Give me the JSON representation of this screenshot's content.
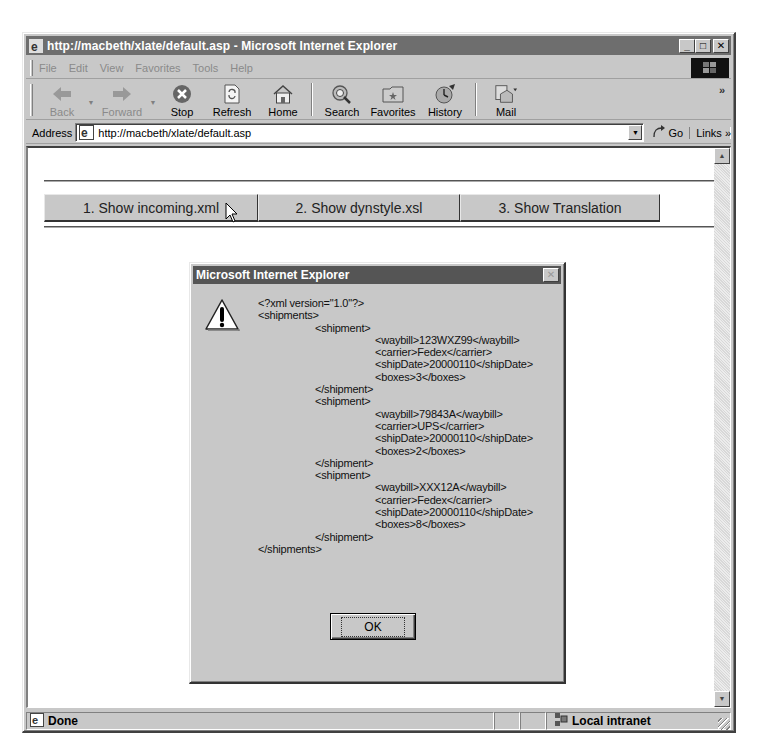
{
  "window": {
    "title": "http://macbeth/xlate/default.asp - Microsoft Internet Explorer",
    "controls": {
      "minimize": "_",
      "maximize": "□",
      "close": "✕"
    }
  },
  "menubar": {
    "items": [
      {
        "label": "File"
      },
      {
        "label": "Edit"
      },
      {
        "label": "View"
      },
      {
        "label": "Favorites"
      },
      {
        "label": "Tools"
      },
      {
        "label": "Help"
      }
    ]
  },
  "toolbar": {
    "buttons": [
      {
        "label": "Back",
        "icon": "back-arrow-icon",
        "disabled": true
      },
      {
        "label": "Forward",
        "icon": "forward-arrow-icon",
        "disabled": true
      },
      {
        "label": "Stop",
        "icon": "stop-icon"
      },
      {
        "label": "Refresh",
        "icon": "refresh-icon"
      },
      {
        "label": "Home",
        "icon": "home-icon"
      },
      {
        "label": "Search",
        "icon": "search-icon"
      },
      {
        "label": "Favorites",
        "icon": "favorites-folder-icon"
      },
      {
        "label": "History",
        "icon": "history-icon"
      },
      {
        "label": "Mail",
        "icon": "mail-icon"
      }
    ],
    "overflow": "»"
  },
  "address": {
    "label": "Address",
    "url": "http://macbeth/xlate/default.asp",
    "go_label": "Go",
    "links_label": "Links »"
  },
  "page": {
    "buttons": [
      {
        "label": "1. Show incoming.xml"
      },
      {
        "label": "2. Show dynstyle.xsl"
      },
      {
        "label": "3. Show Translation"
      }
    ]
  },
  "dialog": {
    "title": "Microsoft Internet Explorer",
    "icon": "warning-icon",
    "lines": [
      {
        "indent": 0,
        "text": "<?xml version=\"1.0\"?>"
      },
      {
        "indent": 0,
        "text": "<shipments>"
      },
      {
        "indent": 1,
        "text": "<shipment>"
      },
      {
        "indent": 2,
        "text": "<waybill>123WXZ99</waybill>"
      },
      {
        "indent": 2,
        "text": "<carrier>Fedex</carrier>"
      },
      {
        "indent": 2,
        "text": "<shipDate>20000110</shipDate>"
      },
      {
        "indent": 2,
        "text": "<boxes>3</boxes>"
      },
      {
        "indent": 1,
        "text": "</shipment>"
      },
      {
        "indent": 1,
        "text": "<shipment>"
      },
      {
        "indent": 2,
        "text": "<waybill>79843A</waybill>"
      },
      {
        "indent": 2,
        "text": "<carrier>UPS</carrier>"
      },
      {
        "indent": 2,
        "text": "<shipDate>20000110</shipDate>"
      },
      {
        "indent": 2,
        "text": "<boxes>2</boxes>"
      },
      {
        "indent": 1,
        "text": "</shipment>"
      },
      {
        "indent": 1,
        "text": "<shipment>"
      },
      {
        "indent": 2,
        "text": "<waybill>XXX12A</waybill>"
      },
      {
        "indent": 2,
        "text": "<carrier>Fedex</carrier>"
      },
      {
        "indent": 2,
        "text": "<shipDate>20000110</shipDate>"
      },
      {
        "indent": 2,
        "text": "<boxes>8</boxes>"
      },
      {
        "indent": 1,
        "text": "</shipment>"
      },
      {
        "indent": 0,
        "text": "</shipments>"
      }
    ],
    "ok_label": "OK"
  },
  "statusbar": {
    "status": "Done",
    "zone": "Local intranet"
  }
}
